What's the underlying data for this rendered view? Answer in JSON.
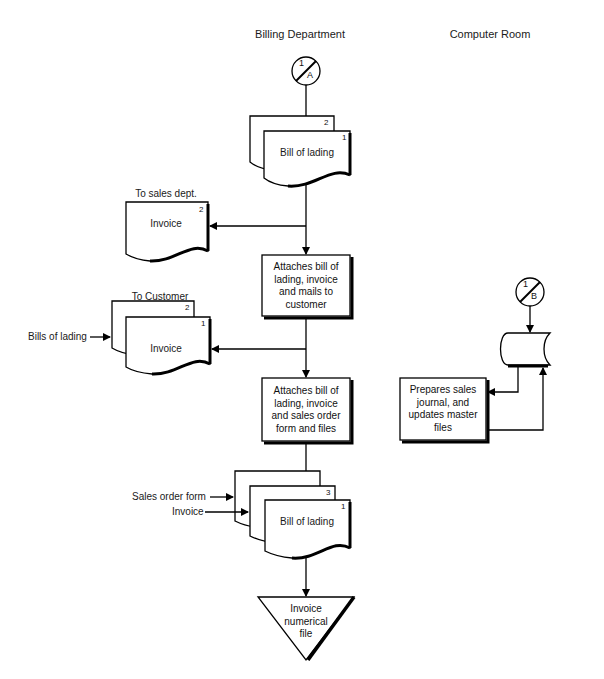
{
  "columns": {
    "billing": "Billing Department",
    "computer_room": "Computer Room"
  },
  "connectors": {
    "billing_in": {
      "top": "1",
      "bottom": "A"
    },
    "computer_in": {
      "top": "1",
      "bottom": "B"
    }
  },
  "documents": {
    "bill_of_lading_top": {
      "label": "Bill of lading",
      "copies": [
        "2",
        "1"
      ]
    },
    "invoice_sales": {
      "label": "Invoice",
      "copy": "2",
      "destination": "To sales dept."
    },
    "invoice_customer": {
      "label": "Invoice",
      "copies": [
        "2",
        "1"
      ],
      "destination": "To Customer",
      "input_label": "Bills of lading"
    },
    "bill_of_lading_bottom": {
      "label": "Bill of lading",
      "copies": [
        "3",
        "1"
      ],
      "input_labels": [
        "Sales order form",
        "Invoice"
      ]
    }
  },
  "processes": {
    "mail_to_customer": {
      "lines": [
        "Attaches bill of",
        "lading, invoice",
        "and mails to",
        "customer"
      ]
    },
    "file_docs": {
      "lines": [
        "Attaches bill of",
        "lading, invoice",
        "and sales order",
        "form and files"
      ]
    },
    "prepare_journal": {
      "lines": [
        "Prepares sales",
        "journal, and",
        "updates master",
        "files"
      ]
    }
  },
  "file": {
    "invoice_numerical": {
      "lines": [
        "Invoice",
        "numerical",
        "file"
      ]
    }
  }
}
